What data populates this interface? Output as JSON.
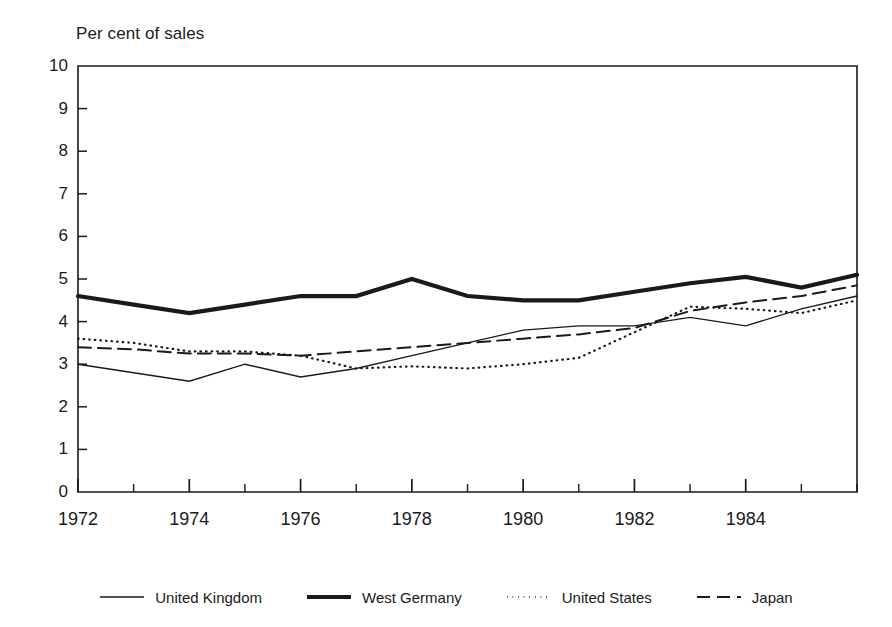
{
  "chart_data": {
    "type": "line",
    "title": "Per cent of sales",
    "xlabel": "",
    "ylabel": "Per cent of sales",
    "xlim": [
      1972,
      1986
    ],
    "ylim": [
      0,
      10
    ],
    "grid": false,
    "legend_position": "bottom",
    "x": [
      1972,
      1973,
      1974,
      1975,
      1976,
      1977,
      1978,
      1979,
      1980,
      1981,
      1982,
      1983,
      1984,
      1985,
      1986
    ],
    "ytick_labels": [
      "10",
      "9",
      "8",
      "7",
      "6",
      "5",
      "4",
      "3",
      "2",
      "1",
      "0"
    ],
    "ytick_values": [
      10,
      9,
      8,
      7,
      6,
      5,
      4,
      3,
      2,
      1,
      0
    ],
    "xtick_labels": [
      "1972",
      "1974",
      "1976",
      "1978",
      "1980",
      "1982",
      "1984"
    ],
    "xtick_values": [
      1972,
      1974,
      1976,
      1978,
      1980,
      1982,
      1984
    ],
    "xminor_values": [
      1973,
      1975,
      1977,
      1979,
      1981,
      1983,
      1985,
      1986
    ],
    "series": [
      {
        "name": "United Kingdom",
        "style": "solid-thin",
        "color": "#1a1a1a",
        "values": [
          3.0,
          2.8,
          2.6,
          3.0,
          2.7,
          2.9,
          3.2,
          3.5,
          3.8,
          3.9,
          3.9,
          4.1,
          3.9,
          4.3,
          4.6
        ]
      },
      {
        "name": "West Germany",
        "style": "solid-thick",
        "color": "#1a1a1a",
        "values": [
          4.6,
          4.4,
          4.2,
          4.4,
          4.6,
          4.6,
          5.0,
          4.6,
          4.5,
          4.5,
          4.7,
          4.9,
          5.05,
          4.8,
          5.1
        ]
      },
      {
        "name": "United States",
        "style": "dotted",
        "color": "#1a1a1a",
        "values": [
          3.6,
          3.5,
          3.3,
          3.3,
          3.2,
          2.9,
          2.95,
          2.9,
          3.0,
          3.15,
          3.75,
          4.35,
          4.3,
          4.2,
          4.5
        ]
      },
      {
        "name": "Japan",
        "style": "dashed",
        "color": "#1a1a1a",
        "values": [
          3.4,
          3.35,
          3.25,
          3.25,
          3.2,
          3.3,
          3.4,
          3.5,
          3.6,
          3.7,
          3.85,
          4.25,
          4.45,
          4.6,
          4.85
        ]
      }
    ]
  },
  "legend": {
    "items": [
      {
        "label": "United Kingdom",
        "sample": "solid-thin-sample"
      },
      {
        "label": "West Germany",
        "sample": "solid-thick-sample"
      },
      {
        "label": "United States",
        "sample": "dotted-sample"
      },
      {
        "label": "Japan",
        "sample": "dashed-sample"
      }
    ]
  }
}
